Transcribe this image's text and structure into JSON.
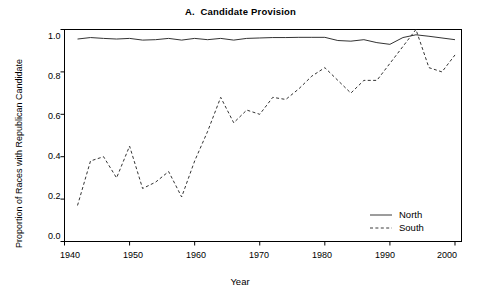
{
  "chart_data": {
    "type": "line",
    "title": "A.  Candidate Provision",
    "xlabel": "Year",
    "ylabel": "Proportion of Races with Republican Candidate",
    "xlim": [
      1940,
      2001
    ],
    "ylim": [
      0.0,
      1.0
    ],
    "xticks": [
      1940,
      1950,
      1960,
      1970,
      1980,
      1990,
      2000
    ],
    "xtick_labels": [
      "1940",
      "1950",
      "1960",
      "1970",
      "1980",
      "1990",
      "2000"
    ],
    "yticks": [
      0.0,
      0.2,
      0.4,
      0.6,
      0.8,
      1.0
    ],
    "ytick_labels": [
      "0.0",
      "0.2",
      "0.4",
      "0.6",
      "0.8",
      "1.0"
    ],
    "grid": false,
    "legend_position": "bottom-right",
    "frame": true,
    "series": [
      {
        "name": "North",
        "style": "solid",
        "color": "#333333",
        "x": [
          1942,
          1944,
          1946,
          1948,
          1950,
          1952,
          1954,
          1956,
          1958,
          1960,
          1962,
          1964,
          1966,
          1968,
          1970,
          1972,
          1974,
          1976,
          1978,
          1980,
          1982,
          1984,
          1986,
          1988,
          1990,
          1992,
          1994,
          1996,
          1998,
          2000
        ],
        "values": [
          0.955,
          0.962,
          0.958,
          0.955,
          0.958,
          0.95,
          0.952,
          0.958,
          0.95,
          0.958,
          0.952,
          0.958,
          0.95,
          0.958,
          0.96,
          0.962,
          0.962,
          0.963,
          0.963,
          0.963,
          0.948,
          0.945,
          0.952,
          0.938,
          0.93,
          0.962,
          0.975,
          0.968,
          0.96,
          0.952
        ]
      },
      {
        "name": "South",
        "style": "dashed",
        "color": "#333333",
        "x": [
          1942,
          1944,
          1946,
          1948,
          1950,
          1952,
          1954,
          1956,
          1958,
          1960,
          1962,
          1964,
          1966,
          1968,
          1970,
          1972,
          1974,
          1976,
          1978,
          1980,
          1982,
          1984,
          1986,
          1988,
          1990,
          1992,
          1994,
          1996,
          1998,
          2000
        ],
        "values": [
          0.17,
          0.38,
          0.4,
          0.3,
          0.45,
          0.25,
          0.28,
          0.33,
          0.21,
          0.38,
          0.52,
          0.68,
          0.56,
          0.62,
          0.6,
          0.68,
          0.67,
          0.72,
          0.78,
          0.82,
          0.76,
          0.7,
          0.76,
          0.76,
          0.84,
          0.92,
          1.0,
          0.82,
          0.8,
          0.88
        ]
      }
    ]
  },
  "legend": {
    "items": [
      {
        "label": "North",
        "style": "solid"
      },
      {
        "label": "South",
        "style": "dashed"
      }
    ]
  }
}
